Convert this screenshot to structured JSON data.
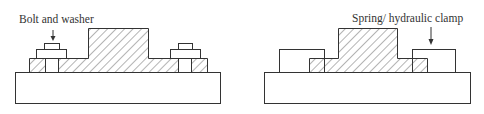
{
  "figure": {
    "colors": {
      "stroke": "#333333",
      "background": "#ffffff",
      "hatch": "#444444"
    },
    "left_diagram": {
      "title": "Bolt-and-washer fixture clamping",
      "label": "Bolt and washer"
    },
    "right_diagram": {
      "title": "Spring/hydraulic clamp fixture",
      "label": "Spring/ hydraulic clamp"
    }
  }
}
